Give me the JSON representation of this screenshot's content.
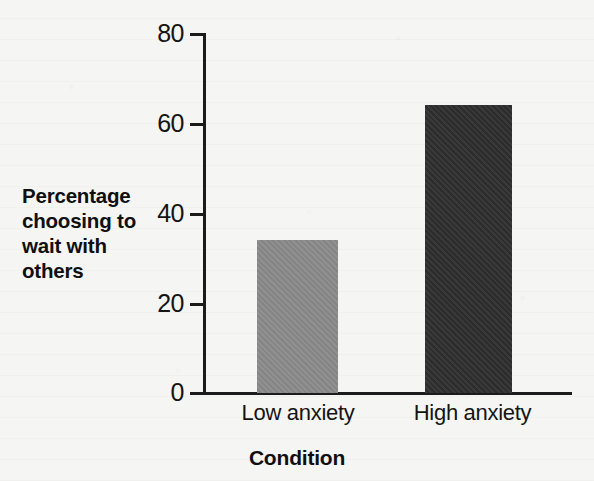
{
  "chart_data": {
    "type": "bar",
    "title": "",
    "subtitle": "",
    "xlabel": "Condition",
    "ylabel": "Percentage choosing to wait with others",
    "categories": [
      "Low anxiety",
      "High anxiety"
    ],
    "values": [
      34,
      64
    ],
    "bar_colors": [
      "#8a8a8a",
      "#2e2e2e"
    ],
    "ylim": [
      0,
      80
    ],
    "yticks": [
      0,
      20,
      40,
      60,
      80
    ],
    "ytick_labels": [
      "0",
      "20",
      "40",
      "60",
      "80"
    ],
    "grid": false,
    "legend": null,
    "annotations": [],
    "background_color": "#f5f5f3",
    "axis_color": "#1b1b1b"
  },
  "axis": {
    "y_title_lines": [
      "Percentage",
      "choosing to",
      "wait with",
      "others"
    ],
    "y_title": "Percentage choosing to wait with others",
    "x_title": "Condition"
  },
  "ticks": {
    "t80": "80",
    "t60": "60",
    "t40": "40",
    "t20": "20",
    "t0": "0"
  },
  "bars": [
    {
      "label": "Low anxiety",
      "value": 34,
      "color": "#8a8a8a"
    },
    {
      "label": "High anxiety",
      "value": 64,
      "color": "#2e2e2e"
    }
  ]
}
